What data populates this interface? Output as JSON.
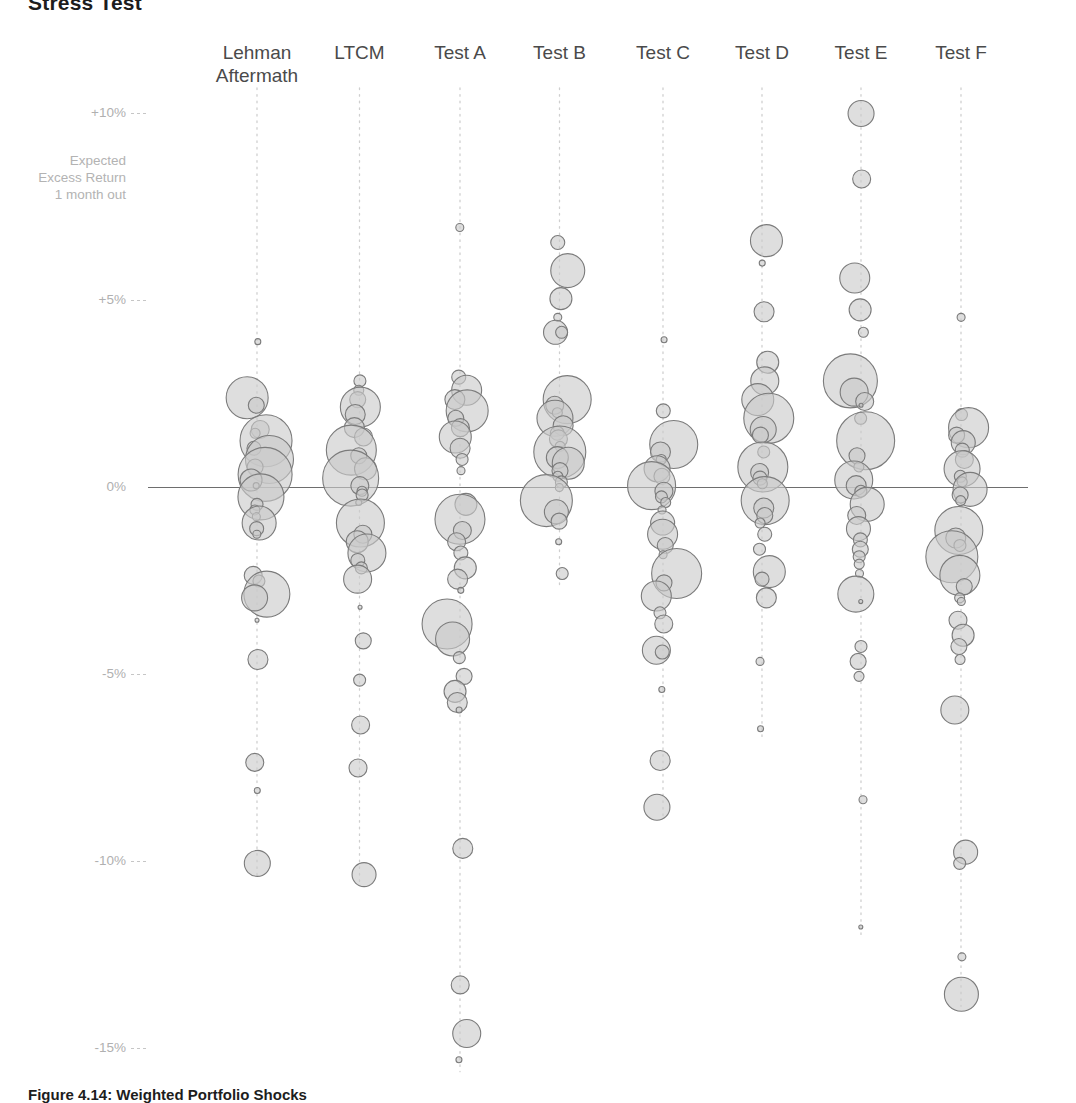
{
  "chart_data": {
    "type": "scatter",
    "title": "Stress Test",
    "caption": "Figure 4.14: Weighted Portfolio Shocks",
    "ylabel": "Expected\nExcess Return\n1 month out",
    "xlabel": "",
    "ylim": [
      -16,
      11
    ],
    "grid": false,
    "legend_position": "none",
    "note": "Bubble/beeswarm chart. Each column is a stress scenario; each bubble is a portfolio position whose vertical placement is expected excess return 1 month out and whose area encodes position weight.",
    "y_ticks": [
      {
        "label": "+10%",
        "value": 10
      },
      {
        "label": "+5%",
        "value": 5
      },
      {
        "label": "0%",
        "value": 0
      },
      {
        "label": "-5%",
        "value": -5
      },
      {
        "label": "-10%",
        "value": -10
      },
      {
        "label": "-15%",
        "value": -15
      }
    ],
    "categories": [
      "Lehman\nAftermath",
      "LTCM",
      "Test A",
      "Test B",
      "Test C",
      "Test D",
      "Test E",
      "Test F"
    ],
    "series": [
      {
        "name": "Lehman Aftermath",
        "points": [
          {
            "y": 3.9,
            "r": 3
          },
          {
            "y": 2.4,
            "r": 21
          },
          {
            "y": 2.2,
            "r": 8
          },
          {
            "y": 1.55,
            "r": 9
          },
          {
            "y": 1.45,
            "r": 5
          },
          {
            "y": 1.25,
            "r": 26
          },
          {
            "y": 1.05,
            "r": 7
          },
          {
            "y": 0.75,
            "r": 24
          },
          {
            "y": 0.55,
            "r": 8
          },
          {
            "y": 0.35,
            "r": 27
          },
          {
            "y": 0.2,
            "r": 11
          },
          {
            "y": 0.05,
            "r": 3
          },
          {
            "y": -0.25,
            "r": 23
          },
          {
            "y": -0.45,
            "r": 6
          },
          {
            "y": -0.6,
            "r": 5
          },
          {
            "y": -0.78,
            "r": 4
          },
          {
            "y": -0.95,
            "r": 17
          },
          {
            "y": -1.1,
            "r": 7
          },
          {
            "y": -1.25,
            "r": 4
          },
          {
            "y": -2.35,
            "r": 9
          },
          {
            "y": -2.5,
            "r": 6
          },
          {
            "y": -2.85,
            "r": 23
          },
          {
            "y": -2.95,
            "r": 13
          },
          {
            "y": -3.55,
            "r": 2
          },
          {
            "y": -4.6,
            "r": 10
          },
          {
            "y": -7.35,
            "r": 9
          },
          {
            "y": -8.1,
            "r": 3
          },
          {
            "y": -10.05,
            "r": 13
          }
        ]
      },
      {
        "name": "LTCM",
        "points": [
          {
            "y": 2.85,
            "r": 6
          },
          {
            "y": 2.6,
            "r": 5
          },
          {
            "y": 2.35,
            "r": 8
          },
          {
            "y": 2.15,
            "r": 20
          },
          {
            "y": 1.95,
            "r": 10
          },
          {
            "y": 1.6,
            "r": 10
          },
          {
            "y": 1.35,
            "r": 9
          },
          {
            "y": 1.0,
            "r": 25
          },
          {
            "y": 0.85,
            "r": 8
          },
          {
            "y": 0.5,
            "r": 11
          },
          {
            "y": 0.25,
            "r": 28
          },
          {
            "y": 0.05,
            "r": 9
          },
          {
            "y": -0.1,
            "r": 5
          },
          {
            "y": -0.2,
            "r": 6
          },
          {
            "y": -0.4,
            "r": 3
          },
          {
            "y": -0.95,
            "r": 24
          },
          {
            "y": -1.25,
            "r": 9
          },
          {
            "y": -1.45,
            "r": 11
          },
          {
            "y": -1.75,
            "r": 19
          },
          {
            "y": -1.95,
            "r": 7
          },
          {
            "y": -2.15,
            "r": 6
          },
          {
            "y": -2.45,
            "r": 14
          },
          {
            "y": -3.2,
            "r": 2
          },
          {
            "y": -4.1,
            "r": 8
          },
          {
            "y": -5.15,
            "r": 6
          },
          {
            "y": -6.35,
            "r": 9
          },
          {
            "y": -7.5,
            "r": 9
          },
          {
            "y": -10.35,
            "r": 12
          }
        ]
      },
      {
        "name": "Test A",
        "points": [
          {
            "y": 6.95,
            "r": 4
          },
          {
            "y": 2.95,
            "r": 7
          },
          {
            "y": 2.6,
            "r": 15
          },
          {
            "y": 2.35,
            "r": 10
          },
          {
            "y": 2.05,
            "r": 21
          },
          {
            "y": 1.85,
            "r": 8
          },
          {
            "y": 1.6,
            "r": 9
          },
          {
            "y": 1.35,
            "r": 16
          },
          {
            "y": 1.05,
            "r": 10
          },
          {
            "y": 0.75,
            "r": 6
          },
          {
            "y": 0.45,
            "r": 4
          },
          {
            "y": -0.45,
            "r": 11
          },
          {
            "y": -0.85,
            "r": 25
          },
          {
            "y": -1.15,
            "r": 9
          },
          {
            "y": -1.45,
            "r": 9
          },
          {
            "y": -1.75,
            "r": 7
          },
          {
            "y": -2.15,
            "r": 11
          },
          {
            "y": -2.45,
            "r": 10
          },
          {
            "y": -2.75,
            "r": 3
          },
          {
            "y": -3.65,
            "r": 25
          },
          {
            "y": -4.05,
            "r": 17
          },
          {
            "y": -4.55,
            "r": 6
          },
          {
            "y": -5.05,
            "r": 8
          },
          {
            "y": -5.45,
            "r": 11
          },
          {
            "y": -5.75,
            "r": 10
          },
          {
            "y": -5.95,
            "r": 3
          },
          {
            "y": -9.65,
            "r": 10
          },
          {
            "y": -13.3,
            "r": 9
          },
          {
            "y": -14.6,
            "r": 14
          },
          {
            "y": -15.3,
            "r": 3
          }
        ]
      },
      {
        "name": "Test B",
        "points": [
          {
            "y": 6.55,
            "r": 7
          },
          {
            "y": 5.8,
            "r": 17
          },
          {
            "y": 5.05,
            "r": 11
          },
          {
            "y": 4.55,
            "r": 4
          },
          {
            "y": 4.15,
            "r": 12
          },
          {
            "y": 4.15,
            "r": 6
          },
          {
            "y": 2.35,
            "r": 24
          },
          {
            "y": 2.2,
            "r": 9
          },
          {
            "y": 2.0,
            "r": 5
          },
          {
            "y": 1.85,
            "r": 18
          },
          {
            "y": 1.65,
            "r": 10
          },
          {
            "y": 1.45,
            "r": 7
          },
          {
            "y": 1.3,
            "r": 9
          },
          {
            "y": 1.1,
            "r": 5
          },
          {
            "y": 0.95,
            "r": 26
          },
          {
            "y": 0.8,
            "r": 11
          },
          {
            "y": 0.65,
            "r": 16
          },
          {
            "y": 0.45,
            "r": 8
          },
          {
            "y": 0.3,
            "r": 5
          },
          {
            "y": 0.15,
            "r": 6
          },
          {
            "y": 0.0,
            "r": 4
          },
          {
            "y": -0.35,
            "r": 26
          },
          {
            "y": -0.65,
            "r": 12
          },
          {
            "y": -0.9,
            "r": 8
          },
          {
            "y": -1.45,
            "r": 3
          },
          {
            "y": -2.3,
            "r": 6
          }
        ]
      },
      {
        "name": "Test C",
        "points": [
          {
            "y": 3.95,
            "r": 3
          },
          {
            "y": 2.05,
            "r": 7
          },
          {
            "y": 1.15,
            "r": 24
          },
          {
            "y": 0.95,
            "r": 10
          },
          {
            "y": 0.75,
            "r": 5
          },
          {
            "y": 0.5,
            "r": 13
          },
          {
            "y": 0.3,
            "r": 8
          },
          {
            "y": 0.05,
            "r": 24
          },
          {
            "y": -0.1,
            "r": 9
          },
          {
            "y": -0.25,
            "r": 6
          },
          {
            "y": -0.4,
            "r": 5
          },
          {
            "y": -0.6,
            "r": 4
          },
          {
            "y": -0.95,
            "r": 12
          },
          {
            "y": -1.25,
            "r": 15
          },
          {
            "y": -1.55,
            "r": 8
          },
          {
            "y": -1.8,
            "r": 4
          },
          {
            "y": -2.3,
            "r": 25
          },
          {
            "y": -2.55,
            "r": 8
          },
          {
            "y": -2.9,
            "r": 15
          },
          {
            "y": -3.35,
            "r": 6
          },
          {
            "y": -3.65,
            "r": 9
          },
          {
            "y": -4.35,
            "r": 14
          },
          {
            "y": -4.4,
            "r": 7
          },
          {
            "y": -5.4,
            "r": 3
          },
          {
            "y": -7.3,
            "r": 10
          },
          {
            "y": -8.55,
            "r": 13
          }
        ]
      },
      {
        "name": "Test D",
        "points": [
          {
            "y": 6.6,
            "r": 16
          },
          {
            "y": 6.0,
            "r": 3
          },
          {
            "y": 4.7,
            "r": 10
          },
          {
            "y": 3.35,
            "r": 11
          },
          {
            "y": 2.85,
            "r": 14
          },
          {
            "y": 2.35,
            "r": 16
          },
          {
            "y": 1.85,
            "r": 25
          },
          {
            "y": 1.55,
            "r": 13
          },
          {
            "y": 1.4,
            "r": 8
          },
          {
            "y": 0.95,
            "r": 6
          },
          {
            "y": 0.55,
            "r": 25
          },
          {
            "y": 0.4,
            "r": 9
          },
          {
            "y": 0.25,
            "r": 7
          },
          {
            "y": 0.1,
            "r": 5
          },
          {
            "y": -0.35,
            "r": 24
          },
          {
            "y": -0.55,
            "r": 10
          },
          {
            "y": -0.75,
            "r": 8
          },
          {
            "y": -0.95,
            "r": 5
          },
          {
            "y": -1.25,
            "r": 7
          },
          {
            "y": -1.65,
            "r": 6
          },
          {
            "y": -2.25,
            "r": 16
          },
          {
            "y": -2.45,
            "r": 7
          },
          {
            "y": -2.95,
            "r": 10
          },
          {
            "y": -4.65,
            "r": 4
          },
          {
            "y": -6.45,
            "r": 3
          }
        ]
      },
      {
        "name": "Test E",
        "points": [
          {
            "y": 10.0,
            "r": 13
          },
          {
            "y": 8.25,
            "r": 9
          },
          {
            "y": 5.6,
            "r": 15
          },
          {
            "y": 4.75,
            "r": 11
          },
          {
            "y": 4.15,
            "r": 5
          },
          {
            "y": 2.85,
            "r": 27
          },
          {
            "y": 2.55,
            "r": 14
          },
          {
            "y": 2.3,
            "r": 9
          },
          {
            "y": 2.2,
            "r": 2
          },
          {
            "y": 1.85,
            "r": 6
          },
          {
            "y": 1.25,
            "r": 29
          },
          {
            "y": 0.85,
            "r": 8
          },
          {
            "y": 0.55,
            "r": 5
          },
          {
            "y": 0.2,
            "r": 19
          },
          {
            "y": 0.05,
            "r": 10
          },
          {
            "y": -0.1,
            "r": 6
          },
          {
            "y": -0.45,
            "r": 17
          },
          {
            "y": -0.75,
            "r": 9
          },
          {
            "y": -1.1,
            "r": 12
          },
          {
            "y": -1.4,
            "r": 7
          },
          {
            "y": -1.65,
            "r": 8
          },
          {
            "y": -1.85,
            "r": 6
          },
          {
            "y": -2.05,
            "r": 5
          },
          {
            "y": -2.3,
            "r": 4
          },
          {
            "y": -2.85,
            "r": 18
          },
          {
            "y": -3.05,
            "r": 2
          },
          {
            "y": -4.25,
            "r": 6
          },
          {
            "y": -4.65,
            "r": 8
          },
          {
            "y": -5.05,
            "r": 5
          },
          {
            "y": -8.35,
            "r": 4
          },
          {
            "y": -11.75,
            "r": 2
          }
        ]
      },
      {
        "name": "Test F",
        "points": [
          {
            "y": 4.55,
            "r": 4
          },
          {
            "y": 1.95,
            "r": 6
          },
          {
            "y": 1.6,
            "r": 20
          },
          {
            "y": 1.4,
            "r": 8
          },
          {
            "y": 1.2,
            "r": 12
          },
          {
            "y": 1.0,
            "r": 7
          },
          {
            "y": 0.75,
            "r": 9
          },
          {
            "y": 0.5,
            "r": 18
          },
          {
            "y": 0.3,
            "r": 6
          },
          {
            "y": 0.15,
            "r": 5
          },
          {
            "y": -0.05,
            "r": 17
          },
          {
            "y": -0.2,
            "r": 8
          },
          {
            "y": -0.35,
            "r": 5
          },
          {
            "y": -1.15,
            "r": 24
          },
          {
            "y": -1.35,
            "r": 10
          },
          {
            "y": -1.55,
            "r": 6
          },
          {
            "y": -1.85,
            "r": 26
          },
          {
            "y": -2.35,
            "r": 20
          },
          {
            "y": -2.65,
            "r": 8
          },
          {
            "y": -2.95,
            "r": 5
          },
          {
            "y": -3.05,
            "r": 4
          },
          {
            "y": -3.55,
            "r": 9
          },
          {
            "y": -3.95,
            "r": 11
          },
          {
            "y": -4.25,
            "r": 8
          },
          {
            "y": -4.6,
            "r": 5
          },
          {
            "y": -5.95,
            "r": 14
          },
          {
            "y": -9.75,
            "r": 12
          },
          {
            "y": -10.05,
            "r": 6
          },
          {
            "y": -12.55,
            "r": 4
          },
          {
            "y": -13.55,
            "r": 17
          }
        ]
      }
    ]
  }
}
